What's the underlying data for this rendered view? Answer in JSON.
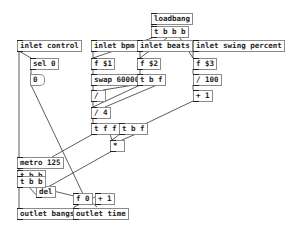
{
  "patch": {
    "objects": [
      {
        "id": "loadbang",
        "text": "loadbang"
      },
      {
        "id": "t-bbb-top",
        "text": "t b b b"
      },
      {
        "id": "inlet-control",
        "text": "inlet control"
      },
      {
        "id": "inlet-bpm",
        "text": "inlet bpm"
      },
      {
        "id": "inlet-beats",
        "text": "inlet beats"
      },
      {
        "id": "inlet-swing",
        "text": "inlet swing percent"
      },
      {
        "id": "sel0",
        "text": "sel 0"
      },
      {
        "id": "f-1",
        "text": "f $1"
      },
      {
        "id": "f-2",
        "text": "f $2"
      },
      {
        "id": "f-3",
        "text": "f $3"
      },
      {
        "id": "swap",
        "text": "swap 60000"
      },
      {
        "id": "tbf-1",
        "text": "t b f"
      },
      {
        "id": "div100",
        "text": "/ 100"
      },
      {
        "id": "div",
        "text": "/"
      },
      {
        "id": "plus1-a",
        "text": "+ 1"
      },
      {
        "id": "div4",
        "text": "/ 4"
      },
      {
        "id": "tff",
        "text": "t f f"
      },
      {
        "id": "tbf-2",
        "text": "t b f"
      },
      {
        "id": "mul",
        "text": "*"
      },
      {
        "id": "metro",
        "text": "metro 125"
      },
      {
        "id": "tbb-1",
        "text": "t b b"
      },
      {
        "id": "del",
        "text": "del"
      },
      {
        "id": "tbb-2",
        "text": "t b b"
      },
      {
        "id": "f-counter",
        "text": "f 0"
      },
      {
        "id": "plus1-b",
        "text": "+ 1"
      },
      {
        "id": "outlet-bangs",
        "text": "outlet bangs"
      },
      {
        "id": "outlet-time",
        "text": "outlet time"
      }
    ],
    "atoms": [
      {
        "id": "msg-zero",
        "text": "0"
      }
    ]
  }
}
